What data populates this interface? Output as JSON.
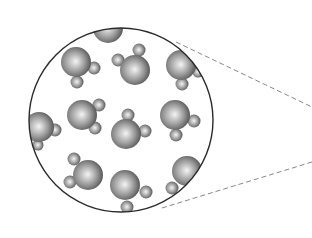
{
  "diagram": {
    "background": "#ffffff",
    "magnifier": {
      "cx": 121,
      "cy": 120,
      "r": 92,
      "stroke": "#2a2a2a",
      "stroke_width": 1.4
    },
    "zoom_lines": {
      "stroke": "#888888",
      "dash": "5,3",
      "lines": [
        {
          "x1": 176,
          "y1": 42,
          "x2": 312,
          "y2": 107
        },
        {
          "x1": 162,
          "y1": 208,
          "x2": 312,
          "y2": 162
        }
      ]
    },
    "atom_colors": {
      "light": "#f4f4f4",
      "mid": "#9a9a9a",
      "dark": "#4a4a4a"
    },
    "molecules": [
      {
        "label": "water-molecule",
        "O": [
          108,
          28,
          15
        ],
        "H": []
      },
      {
        "label": "water-molecule",
        "O": [
          76,
          62,
          15
        ],
        "H": [
          [
            94,
            68,
            6.5
          ],
          [
            77,
            82,
            6.5
          ]
        ]
      },
      {
        "label": "water-molecule",
        "O": [
          135,
          70,
          15
        ],
        "H": [
          [
            118,
            60,
            6.5
          ],
          [
            139,
            50,
            6.5
          ]
        ]
      },
      {
        "label": "water-molecule",
        "O": [
          181,
          65,
          15
        ],
        "H": [
          [
            182,
            84,
            6.5
          ],
          [
            198,
            72,
            5.5
          ]
        ]
      },
      {
        "label": "water-molecule",
        "O": [
          39,
          127,
          15
        ],
        "H": [
          [
            55,
            130,
            6.5
          ],
          [
            38,
            145,
            5.5
          ]
        ]
      },
      {
        "label": "water-molecule",
        "O": [
          82,
          115,
          15
        ],
        "H": [
          [
            99,
            105,
            6.5
          ],
          [
            95,
            128,
            6.5
          ]
        ]
      },
      {
        "label": "water-molecule",
        "O": [
          126,
          134,
          15
        ],
        "H": [
          [
            128,
            115,
            6.5
          ],
          [
            145,
            131,
            6.5
          ]
        ]
      },
      {
        "label": "water-molecule",
        "O": [
          175,
          115,
          15
        ],
        "H": [
          [
            194,
            121,
            6.5
          ],
          [
            176,
            135,
            6.5
          ]
        ]
      },
      {
        "label": "water-molecule",
        "O": [
          88,
          175,
          15
        ],
        "H": [
          [
            74,
            159,
            6.5
          ],
          [
            70,
            182,
            6.5
          ]
        ]
      },
      {
        "label": "water-molecule",
        "O": [
          125,
          185,
          15
        ],
        "H": [
          [
            146,
            192,
            6.5
          ],
          [
            127,
            207,
            6.5
          ]
        ]
      },
      {
        "label": "water-molecule",
        "O": [
          187,
          171,
          15
        ],
        "H": [
          [
            172,
            188,
            6.5
          ]
        ]
      }
    ]
  }
}
